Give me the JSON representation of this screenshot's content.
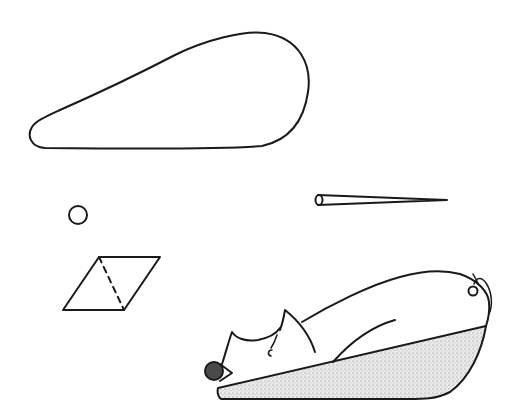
{
  "figure": {
    "colors": {
      "background": "#ffffff",
      "ink": "#1a1a1a",
      "snout_fill": "#4a4a4a",
      "stipple_fill": "#d9d9d9"
    },
    "shapes": [
      {
        "name": "teardrop",
        "bbox": [
          28,
          32,
          310,
          150
        ]
      },
      {
        "name": "small-circle",
        "cx": 78,
        "cy": 215,
        "r": 9
      },
      {
        "name": "cone-needle",
        "from": [
          315,
          200
        ],
        "to": [
          447,
          200
        ]
      },
      {
        "name": "parallelogram",
        "points": [
          [
            99,
            257
          ],
          [
            160,
            257
          ],
          [
            124,
            310
          ],
          [
            63,
            310
          ]
        ],
        "dashed_diagonal": [
          [
            99,
            257
          ],
          [
            124,
            310
          ]
        ]
      },
      {
        "name": "pig-on-wedge",
        "bbox": [
          205,
          265,
          492,
          405
        ]
      }
    ]
  }
}
